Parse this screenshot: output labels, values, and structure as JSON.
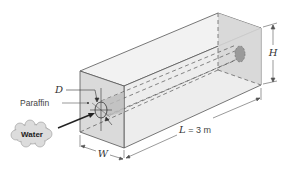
{
  "figure": {
    "labels": {
      "diameter": "D",
      "paraffin": "Paraffin",
      "water": "Water",
      "width": "W",
      "length_var": "L",
      "length_value": " = 3 m",
      "height": "H"
    },
    "colors": {
      "front_face": "#d9d9d9",
      "top_face": "#f0f0f0",
      "side_face": "#ececec",
      "back_face": "#d4d4d4",
      "edge": "#555555",
      "pipe_end": "#999999",
      "cloud": "#dcdcdc"
    }
  }
}
